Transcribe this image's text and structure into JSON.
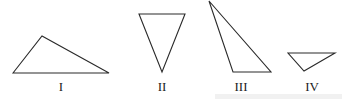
{
  "figure": {
    "triangles": [
      {
        "label": "I",
        "points": "13,73 42,36 109,73",
        "label_x": 61,
        "label_y": 91
      },
      {
        "label": "II",
        "points": "139,14 185,14 162,72",
        "label_x": 162,
        "label_y": 91
      },
      {
        "label": "III",
        "points": "209,1 233,72 271,72",
        "label_x": 241,
        "label_y": 91
      },
      {
        "label": "IV",
        "points": "288,53 335,53 304,71",
        "label_x": 312,
        "label_y": 91
      }
    ]
  }
}
